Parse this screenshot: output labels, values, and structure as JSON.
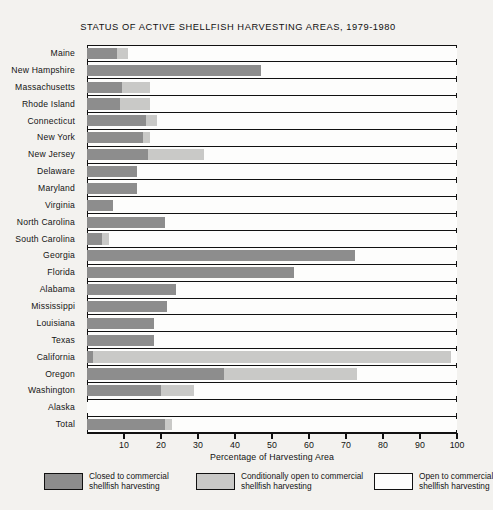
{
  "chart_data": {
    "type": "bar",
    "orientation": "horizontal",
    "stacked": true,
    "title": "STATUS OF ACTIVE SHELLFISH HARVESTING AREAS, 1979-1980",
    "xlabel": "Percentage of Harvesting Area",
    "ylabel": "",
    "xlim": [
      0,
      100
    ],
    "xticks": [
      10,
      20,
      30,
      40,
      50,
      60,
      70,
      80,
      90,
      100
    ],
    "xticklabels": [
      "10",
      "20",
      "30",
      "40",
      "50",
      "60",
      "70",
      "80",
      "90",
      "100"
    ],
    "grid": false,
    "legend_position": "bottom",
    "categories": [
      "Maine",
      "New Hampshire",
      "Massachusetts",
      "Rhode Island",
      "Connecticut",
      "New York",
      "New Jersey",
      "Delaware",
      "Maryland",
      "Virginia",
      "North Carolina",
      "South Carolina",
      "Georgia",
      "Florida",
      "Alabama",
      "Mississippi",
      "Louisiana",
      "Texas",
      "California",
      "Oregon",
      "Washington",
      "Alaska",
      "Total"
    ],
    "series": [
      {
        "name": "Closed to commercial shellfish harvesting",
        "color": "#8d8d8d",
        "values": [
          8,
          47,
          9.5,
          9,
          16,
          15,
          16.5,
          13.5,
          13.5,
          7,
          21,
          4,
          72.5,
          56,
          24,
          21.5,
          18,
          18,
          1.5,
          37,
          20,
          0,
          21
        ]
      },
      {
        "name": "Conditionally open to commercial shellfish harvesting",
        "color": "#c9c9c7",
        "values": [
          3,
          0,
          7.5,
          8,
          3,
          2,
          15,
          0,
          0,
          0,
          0,
          2,
          0,
          0,
          0,
          0,
          0,
          0,
          97,
          36,
          9,
          0,
          2
        ]
      },
      {
        "name": "Open to commercial shellfish harvesting",
        "color": "#fdfdfc",
        "values": [
          89,
          53,
          83,
          83,
          81,
          83,
          68.5,
          86.5,
          86.5,
          93,
          79,
          94,
          27.5,
          44,
          76,
          78.5,
          82,
          82,
          1.5,
          27,
          71,
          100,
          77
        ]
      }
    ],
    "legend": [
      {
        "label_line1": "Closed to commercial",
        "label_line2": "shellfish harvesting",
        "color": "#8d8d8d"
      },
      {
        "label_line1": "Conditionally open to commercial",
        "label_line2": "shellfish harvesting",
        "color": "#c9c9c7"
      },
      {
        "label_line1": "Open to commercial",
        "label_line2": "shellfish harvesting",
        "color": "#fdfdfc"
      }
    ]
  }
}
